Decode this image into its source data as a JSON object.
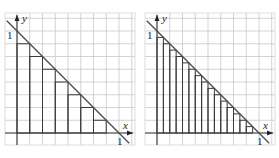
{
  "panels": [
    {
      "id": "left",
      "n": 8,
      "origin": [
        17,
        133
      ],
      "unit_px": 102,
      "frame": [
        5,
        13,
        130,
        132
      ],
      "labels": {
        "x_axis": "x",
        "y_axis": "y",
        "x_one": "1",
        "y_one": "1"
      }
    },
    {
      "id": "right",
      "n": 16,
      "origin": [
        157,
        133
      ],
      "unit_px": 102,
      "frame": [
        145,
        13,
        130,
        132
      ],
      "labels": {
        "x_axis": "x",
        "y_axis": "y",
        "x_one": "1",
        "y_one": "1"
      }
    }
  ],
  "curve": "y = 1 - x",
  "colors": {
    "line": "#3a3a3a",
    "grid": "#c8c8c8"
  }
}
